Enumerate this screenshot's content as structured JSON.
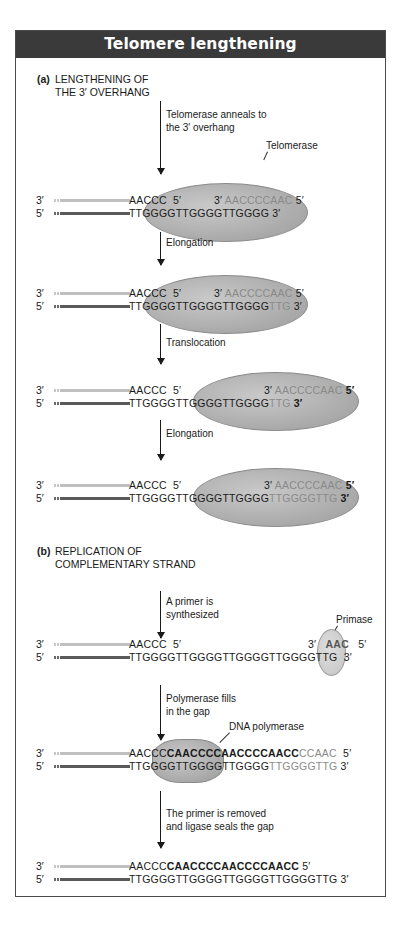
{
  "title": "Telomere lengthening",
  "colors": {
    "header_bg": "#3a3a3a",
    "header_text": "#ffffff",
    "enzyme_fill": "#aaaaaa",
    "new_nucleotides": "#8a8a8a",
    "template_strand_line": "#c8c8c8",
    "parent_strand_line": "#5a5a5a"
  },
  "section_a": {
    "tag": "(a)",
    "title_line1": "LENGTHENING OF",
    "title_line2": "THE 3′ OVERHANG",
    "steps": [
      {
        "label_line1": "Telomerase anneals to",
        "label_line2": "the 3′ overhang",
        "enzyme": "Telomerase",
        "top_end": "3′",
        "top_seq": "AACCC",
        "top_seq_end": "5′",
        "rna_start": "3′",
        "rna_template": "AACCCCAAC",
        "rna_end": "5′",
        "bottom_end": "5′",
        "bottom_seq": "TTGGGGTTGGGGTTGGGG",
        "bottom_new": "",
        "bottom_seq_end": "3′"
      },
      {
        "label_line1": "Elongation",
        "top_end": "3′",
        "top_seq": "AACCC",
        "top_seq_end": "5′",
        "rna_start": "3′",
        "rna_template": "AACCCCAAC",
        "rna_end": "5′",
        "bottom_end": "5′",
        "bottom_seq": "TTGGGGTTGGGGTTGGGG",
        "bottom_new": "TTG",
        "bottom_seq_end": "3′"
      },
      {
        "label_line1": "Translocation",
        "top_end": "3′",
        "top_seq": "AACCC",
        "top_seq_end": "5′",
        "rna_start": "3′",
        "rna_template": "AACCCCAAC",
        "rna_end": "5′",
        "bottom_end": "5′",
        "bottom_seq": "TTGGGGTTGGGGTTGGGG",
        "bottom_new": "TTG",
        "bottom_seq_end": "3′"
      },
      {
        "label_line1": "Elongation",
        "top_end": "3′",
        "top_seq": "AACCC",
        "top_seq_end": "5′",
        "rna_start": "3′",
        "rna_template": "AACCCCAAC",
        "rna_end": "5′",
        "bottom_end": "5′",
        "bottom_seq": "TTGGGGTTGGGGTTGGGG",
        "bottom_new": "TTGGGGTTG",
        "bottom_seq_end": "3′"
      }
    ]
  },
  "section_b": {
    "tag": "(b)",
    "title_line1": "REPLICATION OF",
    "title_line2": "COMPLEMENTARY STRAND",
    "steps": [
      {
        "label_line1": "A primer is",
        "label_line2": "synthesized",
        "enzyme": "Primase",
        "top_end": "3′",
        "top_seq": "AACCC",
        "top_seq_end": "5′",
        "primer_start": "3′",
        "primer": "AAC",
        "primer_end": "5′",
        "bottom_end": "5′",
        "bottom_seq": "TTGGGGTTGGGGTTGGGGTTGGGGTTG",
        "bottom_seq_end": "3′"
      },
      {
        "label_line1": "Polymerase fills",
        "label_line2": "in the gap",
        "enzyme": "DNA polymerase",
        "top_end": "3′",
        "top_seq": "AACCC",
        "top_filled": "CAACCCCAACCCCAACC",
        "top_primer": "CCAAC",
        "top_seq_end": "5′",
        "bottom_end": "5′",
        "bottom_seq": "TTGGGGTTGGGGTTGGGG",
        "bottom_new": "TTGGGGTTG",
        "bottom_seq_end": "3′"
      },
      {
        "label_line1": "The primer is removed",
        "label_line2": "and ligase seals the gap",
        "top_end": "3′",
        "top_seq": "AACCC",
        "top_filled": "CAACCCCAACCCCAACC",
        "top_seq_end": "5′",
        "bottom_end": "5′",
        "bottom_seq": "TTGGGGTTGGGGTTGGGGTTGGGGTTG",
        "bottom_seq_end": "3′"
      }
    ]
  }
}
